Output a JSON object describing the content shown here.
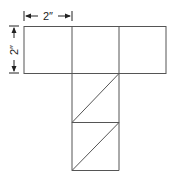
{
  "diagram": {
    "type": "net",
    "dimensions": {
      "width_label": "2″",
      "height_label": "2″"
    },
    "colors": {
      "line": "#555555",
      "dim": "#222222",
      "background": "#ffffff"
    },
    "top_row_squares": 3,
    "column_squares_below": 2,
    "column_diagonals": 2
  }
}
